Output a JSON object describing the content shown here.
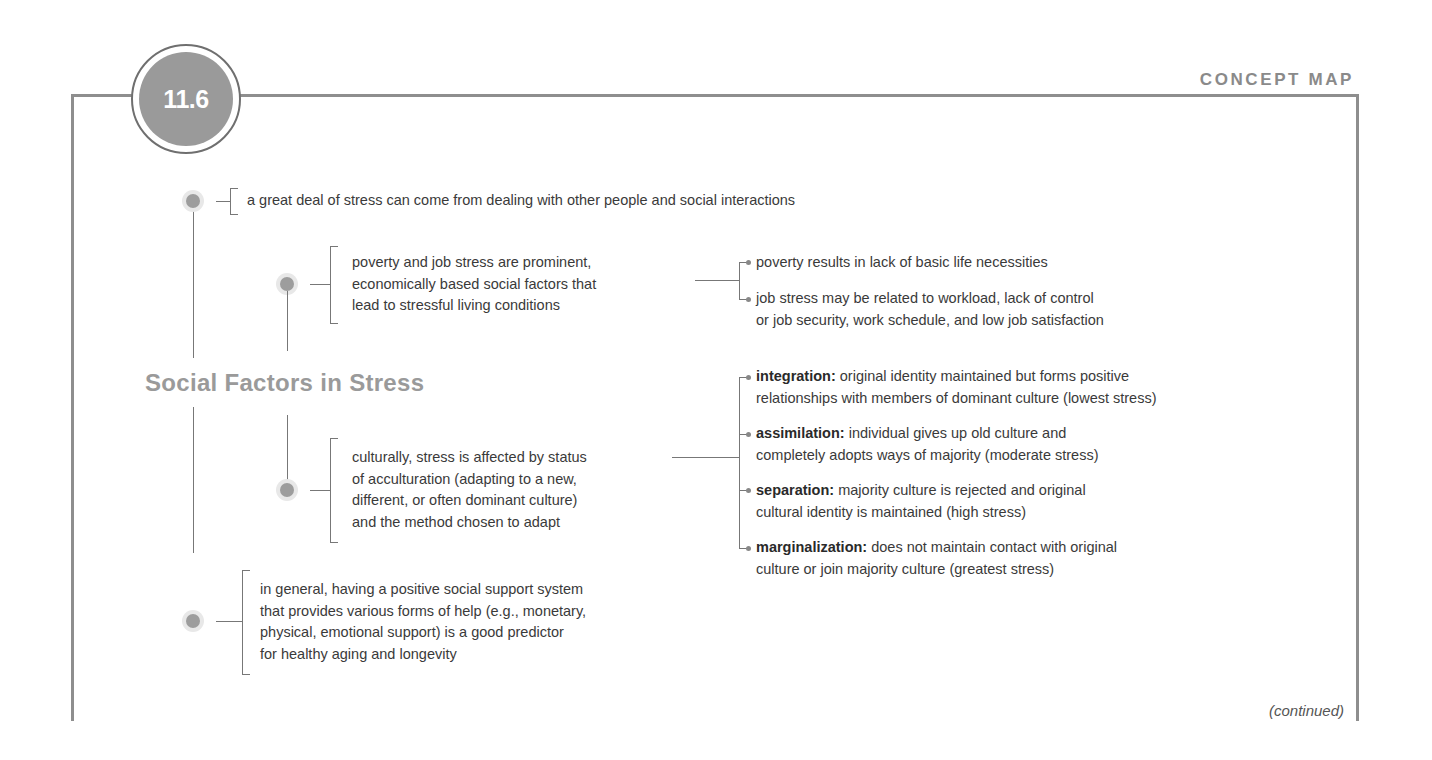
{
  "header": {
    "section_number": "11.6",
    "label": "CONCEPT MAP"
  },
  "title": "Social Factors in Stress",
  "nodes": [
    {
      "text": "a great deal of stress can come from dealing with other people and social interactions"
    },
    {
      "text_lines": [
        "poverty and job stress are prominent,",
        "economically based social factors that",
        "lead to stressful living conditions"
      ],
      "children": [
        {
          "lines": [
            "poverty results in lack of basic life necessities"
          ]
        },
        {
          "lines": [
            "job stress may be related to workload, lack of control",
            "or job security, work schedule, and low job satisfaction"
          ]
        }
      ]
    },
    {
      "text_lines": [
        "culturally, stress is affected by status",
        "of acculturation (adapting to a new,",
        "different, or often dominant culture)",
        "and the method chosen to adapt"
      ],
      "children": [
        {
          "term": "integration:",
          "lines": [
            " original identity maintained but forms positive",
            "relationships with members of dominant culture (lowest stress)"
          ]
        },
        {
          "term": "assimilation:",
          "lines": [
            " individual gives up old culture and",
            "completely adopts ways of majority (moderate stress)"
          ]
        },
        {
          "term": "separation:",
          "lines": [
            " majority culture is rejected and original",
            "cultural identity is maintained (high stress)"
          ]
        },
        {
          "term": "marginalization:",
          "lines": [
            " does not maintain contact with original",
            "culture or join majority culture (greatest stress)"
          ]
        }
      ]
    },
    {
      "text_lines": [
        "in general, having a positive social support system",
        "that provides various forms of help (e.g., monetary,",
        "physical, emotional support) is a good predictor",
        "for healthy aging and longevity"
      ]
    }
  ],
  "footer": {
    "continued": "(continued)"
  },
  "colors": {
    "frame": "#8e8e8e",
    "badge": "#9a9a9a",
    "title": "#9a9a9a",
    "text": "#3a3a3a"
  }
}
